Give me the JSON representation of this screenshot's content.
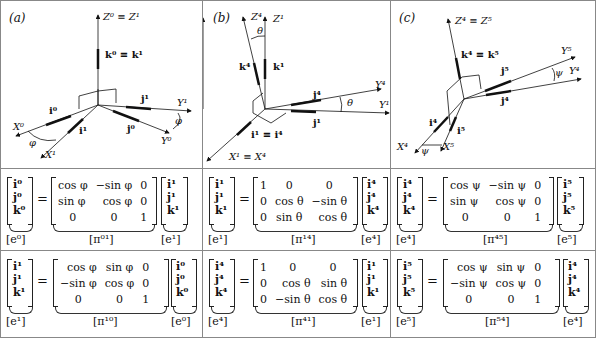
{
  "panels": [
    {
      "label": "(a)",
      "axes": {
        "z": "Z⁰ ≡ Z¹",
        "k": "k⁰ ≡ k¹",
        "j1": "j¹",
        "y1": "Y¹",
        "i0": "i⁰",
        "x0": "X⁰",
        "i1": "i¹",
        "j0": "j⁰",
        "y0": "Y⁰",
        "x1": "X¹",
        "angle1": "φ",
        "angle2": "φ"
      },
      "eq1": {
        "lhs": [
          "i⁰",
          "j⁰",
          "k⁰"
        ],
        "lhs_caption": "[e⁰]",
        "matrix": [
          [
            "cos φ",
            "−sin φ",
            "0"
          ],
          [
            "sin φ",
            "cos φ",
            "0"
          ],
          [
            "0",
            "0",
            "1"
          ]
        ],
        "matrix_caption": "[π⁰¹]",
        "rhs": [
          "i¹",
          "j¹",
          "k¹"
        ],
        "rhs_caption": "[e¹]"
      },
      "eq2": {
        "lhs": [
          "i¹",
          "j¹",
          "k¹"
        ],
        "lhs_caption": "[e¹]",
        "matrix": [
          [
            "cos φ",
            "sin φ",
            "0"
          ],
          [
            "−sin φ",
            "cos φ",
            "0"
          ],
          [
            "0",
            "0",
            "1"
          ]
        ],
        "matrix_caption": "[π¹⁰]",
        "rhs": [
          "i⁰",
          "j⁰",
          "k⁰"
        ],
        "rhs_caption": "[e⁰]"
      }
    },
    {
      "label": "(b)",
      "axes": {
        "z4": "Z⁴",
        "z1": "Z¹",
        "theta1": "θ",
        "k4": "k⁴",
        "k1": "k¹",
        "y4": "Y⁴",
        "j4": "j⁴",
        "theta2": "θ",
        "y1": "Y¹",
        "j1": "j¹",
        "i": "i¹ ≡ i⁴",
        "x": "X¹ ≡ X⁴"
      },
      "eq1": {
        "lhs": [
          "i¹",
          "j¹",
          "k¹"
        ],
        "lhs_caption": "[e¹]",
        "matrix": [
          [
            "1",
            "0",
            "0"
          ],
          [
            "0",
            "cos θ",
            "−sin θ"
          ],
          [
            "0",
            "sin θ",
            "cos θ"
          ]
        ],
        "matrix_caption": "[π¹⁴]",
        "rhs": [
          "i⁴",
          "j⁴",
          "k⁴"
        ],
        "rhs_caption": "[e⁴]"
      },
      "eq2": {
        "lhs": [
          "i⁴",
          "j⁴",
          "k⁴"
        ],
        "lhs_caption": "[e⁴]",
        "matrix": [
          [
            "1",
            "0",
            "0"
          ],
          [
            "0",
            "cos θ",
            "sin θ"
          ],
          [
            "0",
            "−sin θ",
            "cos θ"
          ]
        ],
        "matrix_caption": "[π⁴¹]",
        "rhs": [
          "i¹",
          "j¹",
          "k¹"
        ],
        "rhs_caption": "[e¹]"
      }
    },
    {
      "label": "(c)",
      "axes": {
        "z": "Z⁴ ≡ Z⁵",
        "k": "k⁴ ≡ k⁵",
        "y5": "Y⁵",
        "psi1": "ψ",
        "y4": "Y⁴",
        "j5": "j⁵",
        "j4": "j⁴",
        "i4": "i⁴",
        "i5": "i⁵",
        "x4": "X⁴",
        "psi2": "ψ",
        "x5": "X⁵"
      },
      "eq1": {
        "lhs": [
          "i⁴",
          "j⁴",
          "k⁴"
        ],
        "lhs_caption": "[e⁴]",
        "matrix": [
          [
            "cos ψ",
            "−sin ψ",
            "0"
          ],
          [
            "sin ψ",
            "cos ψ",
            "0"
          ],
          [
            "0",
            "0",
            "1"
          ]
        ],
        "matrix_caption": "[π⁴⁵]",
        "rhs": [
          "i⁵",
          "j⁵",
          "k⁵"
        ],
        "rhs_caption": "[e⁵]"
      },
      "eq2": {
        "lhs": [
          "i⁵",
          "j⁵",
          "k⁵"
        ],
        "lhs_caption": "[e⁵]",
        "matrix": [
          [
            "cos ψ",
            "sin ψ",
            "0"
          ],
          [
            "−sin ψ",
            "cos ψ",
            "0"
          ],
          [
            "0",
            "0",
            "1"
          ]
        ],
        "matrix_caption": "[π⁵⁴]",
        "rhs": [
          "i⁴",
          "j⁴",
          "k⁴"
        ],
        "rhs_caption": "[e⁴]"
      }
    }
  ],
  "colors": {
    "ink": "#111111",
    "border": "#888888",
    "background": "#ffffff"
  }
}
